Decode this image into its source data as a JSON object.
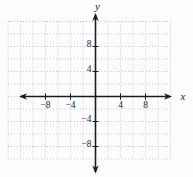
{
  "figure": {
    "x_axis_label": "x",
    "y_axis_label": "y"
  },
  "colors": {
    "background": "#fdfdfd",
    "grid": "#b4b7bf",
    "axis": "#1c1c1c",
    "text": "#1c1c1c"
  },
  "chart_data": {
    "type": "scatter",
    "title": "",
    "xlabel": "x",
    "ylabel": "y",
    "series": [],
    "grid": true,
    "grid_style": "dotted",
    "grid_step": 2,
    "xlim": [
      -14,
      12
    ],
    "ylim": [
      -10,
      12
    ],
    "x_tick_values": [
      -8,
      -4,
      4,
      8
    ],
    "x_tick_labels": [
      "−8",
      "−4",
      "4",
      "8"
    ],
    "y_tick_values": [
      8,
      4,
      -4,
      -8
    ],
    "y_tick_labels": [
      "8",
      "4",
      "−4",
      "−8"
    ],
    "legend": false
  }
}
